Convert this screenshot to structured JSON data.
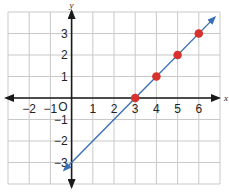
{
  "chart_data": {
    "type": "line",
    "title": "",
    "xlabel": "x",
    "ylabel": "y",
    "xlim": [
      -3,
      7
    ],
    "ylim": [
      -4,
      4
    ],
    "grid": true,
    "origin_label": "O",
    "x_ticks": [
      -2,
      -1,
      1,
      2,
      3,
      4,
      5,
      6
    ],
    "x_tick_labels": [
      "−2",
      "−1",
      "1",
      "2",
      "3",
      "4",
      "5",
      "6"
    ],
    "y_ticks": [
      3,
      2,
      1,
      -1,
      -2,
      -3
    ],
    "y_tick_labels": [
      "3",
      "2",
      "1",
      "−1",
      "−2",
      "−3"
    ],
    "line": {
      "equation": "y = x - 3",
      "slope": 1,
      "intercept": -3,
      "color": "#3a6fb5",
      "arrows": "both"
    },
    "points": [
      {
        "x": 3,
        "y": 0
      },
      {
        "x": 4,
        "y": 1
      },
      {
        "x": 5,
        "y": 2
      },
      {
        "x": 6,
        "y": 3
      }
    ],
    "point_color": "#d8322e",
    "axis_color": "#1a1a1a",
    "grid_color": "#c9c9c9"
  }
}
